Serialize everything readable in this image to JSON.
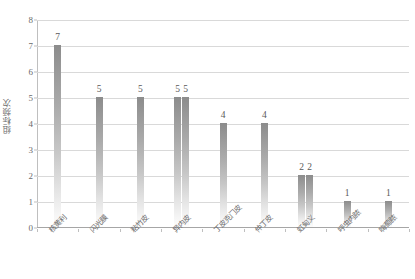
{
  "chart_data": {
    "type": "bar",
    "title": "",
    "subtitle": "",
    "xlabel": "",
    "ylabel": "组标频次",
    "ylim": [
      0,
      8
    ],
    "ytick_interval": 1,
    "yticks": [
      "0",
      "1",
      "2",
      "3",
      "4",
      "5",
      "6",
      "7",
      "8"
    ],
    "grid": "horizontal",
    "legend": "none",
    "categories": [
      "核黄利",
      "闪光膜",
      "粘竹皮",
      "异内皮",
      "丁皮克门皮",
      "仲丁皮",
      "虹甸义",
      "呼虫内脓",
      "嗨萄脓"
    ],
    "groups": [
      {
        "category": "核黄利",
        "values": [
          7
        ],
        "labels": [
          "7"
        ]
      },
      {
        "category": "闪光膜",
        "values": [
          5
        ],
        "labels": [
          "5"
        ]
      },
      {
        "category": "粘竹皮",
        "values": [
          5
        ],
        "labels": [
          "5"
        ]
      },
      {
        "category": "异内皮",
        "values": [
          5,
          5
        ],
        "labels": [
          "5",
          "5"
        ]
      },
      {
        "category": "丁皮克门皮",
        "values": [
          4
        ],
        "labels": [
          "4"
        ]
      },
      {
        "category": "仲丁皮",
        "values": [
          4
        ],
        "labels": [
          "4"
        ]
      },
      {
        "category": "虹甸义",
        "values": [
          2,
          2
        ],
        "labels": [
          "2",
          "2"
        ]
      },
      {
        "category": "呼虫内脓",
        "values": [
          1
        ],
        "labels": [
          "1"
        ]
      },
      {
        "category": "嗨萄脓",
        "values": [
          1
        ],
        "labels": [
          "1"
        ]
      }
    ],
    "values_flat": [
      7,
      5,
      5,
      5,
      5,
      4,
      4,
      2,
      2,
      1,
      1
    ],
    "bar_count": 11,
    "colors": {
      "bar_top": "#8c8c8c",
      "bar_bottom": "#fdfdfd",
      "gridline": "#d9d9d9",
      "axis": "#a6a6a6",
      "text": "#6b6b6b",
      "background": "#ffffff"
    }
  }
}
